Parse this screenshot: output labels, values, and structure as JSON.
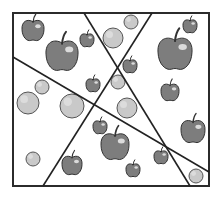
{
  "diagram": {
    "frame": {
      "x": 13,
      "y": 13,
      "w": 196,
      "h": 173,
      "stroke": "#2b2b2b"
    },
    "lines": [
      {
        "id": "line-a",
        "x1": 84,
        "y1": 13,
        "x2": 190,
        "y2": 186
      },
      {
        "id": "line-b",
        "x1": 152,
        "y1": 13,
        "x2": 43,
        "y2": 186
      },
      {
        "id": "line-c",
        "x1": 13,
        "y1": 57,
        "x2": 209,
        "y2": 172
      }
    ],
    "colors": {
      "apple_fill": "#7d7d7d",
      "apple_stroke": "#333333",
      "apple_highlight": "#e6e6e6",
      "ball_fill": "#c9c9c9",
      "ball_stroke": "#555555",
      "line": "#222222"
    },
    "apples": [
      {
        "x": 33,
        "y": 30,
        "r": 11
      },
      {
        "x": 62,
        "y": 55,
        "r": 16
      },
      {
        "x": 87,
        "y": 40,
        "r": 7
      },
      {
        "x": 190,
        "y": 26,
        "r": 7
      },
      {
        "x": 175,
        "y": 53,
        "r": 17
      },
      {
        "x": 130,
        "y": 66,
        "r": 7
      },
      {
        "x": 170,
        "y": 92,
        "r": 9
      },
      {
        "x": 93,
        "y": 85,
        "r": 7
      },
      {
        "x": 100,
        "y": 127,
        "r": 7
      },
      {
        "x": 115,
        "y": 146,
        "r": 14
      },
      {
        "x": 72,
        "y": 165,
        "r": 10
      },
      {
        "x": 193,
        "y": 131,
        "r": 12
      },
      {
        "x": 161,
        "y": 157,
        "r": 7
      },
      {
        "x": 133,
        "y": 170,
        "r": 7
      }
    ],
    "balls": [
      {
        "x": 113,
        "y": 38,
        "r": 10
      },
      {
        "x": 131,
        "y": 22,
        "r": 7
      },
      {
        "x": 42,
        "y": 87,
        "r": 7
      },
      {
        "x": 28,
        "y": 103,
        "r": 11
      },
      {
        "x": 72,
        "y": 106,
        "r": 12
      },
      {
        "x": 118,
        "y": 82,
        "r": 7
      },
      {
        "x": 127,
        "y": 108,
        "r": 10
      },
      {
        "x": 33,
        "y": 159,
        "r": 7
      },
      {
        "x": 196,
        "y": 176,
        "r": 7
      }
    ]
  }
}
